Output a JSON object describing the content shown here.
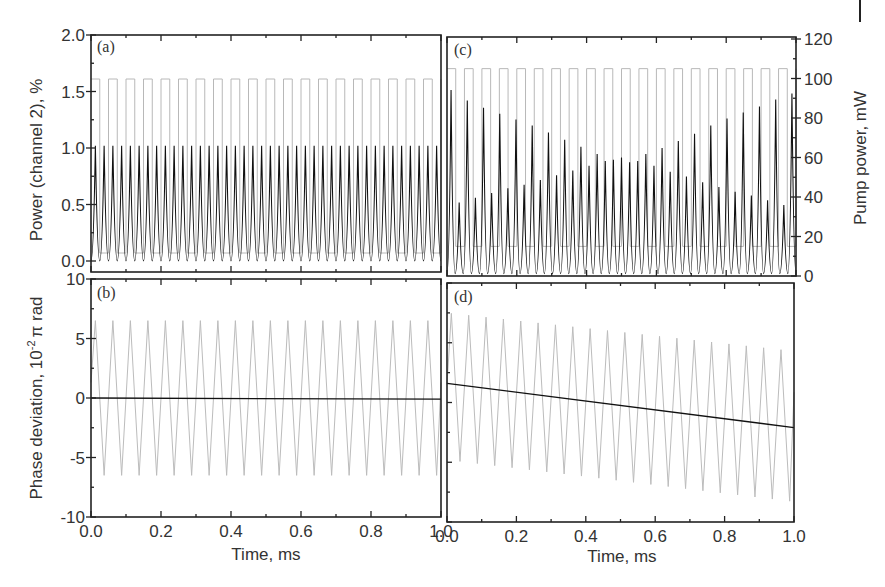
{
  "figure": {
    "width": 885,
    "height": 587,
    "colors": {
      "frame": "#222222",
      "signal": "#111111",
      "pump_square": "#b8b8b8",
      "phase_triangle": "#bcbcbc",
      "text": "#333333"
    }
  },
  "chart_data": [
    {
      "panel": "(a)",
      "type": "line",
      "title": "",
      "xlabel": "",
      "ylabel": "Power (channel 2), %",
      "xlim": [
        0.0,
        1.0
      ],
      "ylim": [
        0.0,
        2.0
      ],
      "yticks": [
        "0.0",
        "0.5",
        "1.0",
        "1.5",
        "2.0"
      ],
      "grid": false,
      "series": [
        {
          "name": "Power channel 2 (black)",
          "style": "periodic peaks",
          "periods_per_ms": 40,
          "min": 0.0,
          "max": 1.02
        },
        {
          "name": "Pump power (gray square wave)",
          "style": "square",
          "periods_per_ms": 20,
          "low_mW": 15,
          "high_mW": 105
        }
      ]
    },
    {
      "panel": "(b)",
      "type": "line",
      "xlabel": "Time, ms",
      "ylabel": "Phase deviation, 10^-2 π rad",
      "xlim": [
        0.0,
        1.0
      ],
      "ylim": [
        -10,
        10
      ],
      "xticks": [
        "0.0",
        "0.2",
        "0.4",
        "0.6",
        "0.8",
        "1.0"
      ],
      "yticks": [
        "-10",
        "-5",
        "0",
        "5",
        "10"
      ],
      "grid": false,
      "series": [
        {
          "name": "Phase deviation (gray triangle)",
          "style": "triangle",
          "periods_per_ms": 20,
          "min": -6.5,
          "max": 6.5
        },
        {
          "name": "Mean phase (black)",
          "style": "line",
          "x": [
            0.0,
            1.0
          ],
          "y": [
            0.0,
            -0.1
          ]
        }
      ]
    },
    {
      "panel": "(c)",
      "type": "line",
      "xlabel": "",
      "ylabel_right": "Pump power, mW",
      "xlim": [
        0.0,
        1.0
      ],
      "ylim_right": [
        0,
        120
      ],
      "yticks_right": [
        "0",
        "20",
        "40",
        "60",
        "80",
        "100",
        "120"
      ],
      "grid": false,
      "series": [
        {
          "name": "Power channel 2 (black)",
          "style": "periodic peaks alternating",
          "major_peaks_pct": [
            1.57,
            1.48,
            1.42,
            1.37,
            1.32,
            1.27,
            1.21,
            1.15,
            1.09,
            1.03,
            0.98,
            0.96,
            1.03,
            1.08,
            1.14,
            1.2,
            1.27,
            1.33,
            1.38,
            1.43,
            1.49,
            1.54
          ],
          "minor_peaks_pct": [
            0.62,
            0.66,
            0.7,
            0.74,
            0.77,
            0.81,
            0.85,
            0.89,
            0.93,
            0.97,
            1.0,
            0.97,
            0.93,
            0.88,
            0.84,
            0.79,
            0.75,
            0.71,
            0.68,
            0.64,
            0.6
          ],
          "min": 0.02
        },
        {
          "name": "Pump power (gray square wave)",
          "style": "square",
          "periods_per_ms": 20,
          "low_mW": 15,
          "high_mW": 105
        }
      ]
    },
    {
      "panel": "(d)",
      "type": "line",
      "xlabel": "Time, ms",
      "xlim": [
        0.0,
        1.0
      ],
      "ylim": [
        -10,
        10
      ],
      "xticks": [
        "0.0",
        "0.2",
        "0.4",
        "0.6",
        "0.8",
        "1.0"
      ],
      "grid": false,
      "series": [
        {
          "name": "Phase deviation (gray triangle, drifting)",
          "style": "triangle",
          "periods_per_ms": 20,
          "start_max": 7.5,
          "start_min": -4.8,
          "end_max": 4.3,
          "end_min": -8.3
        },
        {
          "name": "Mean phase (black)",
          "style": "line",
          "x": [
            0.0,
            1.0
          ],
          "y": [
            1.6,
            -2.1
          ]
        }
      ]
    }
  ],
  "labels": {
    "panel_a": "(a)",
    "panel_b": "(b)",
    "panel_c": "(c)",
    "panel_d": "(d)",
    "ylabel_top_left": "Power (channel 2), %",
    "ylabel_bottom_left": "Phase deviation, 10",
    "ylabel_bottom_left_exp": "-2",
    "ylabel_bottom_left_tail": "π rad",
    "ylabel_right": "Pump power, mW",
    "xlabel_left": "Time, ms",
    "xlabel_right": "Time, ms"
  }
}
